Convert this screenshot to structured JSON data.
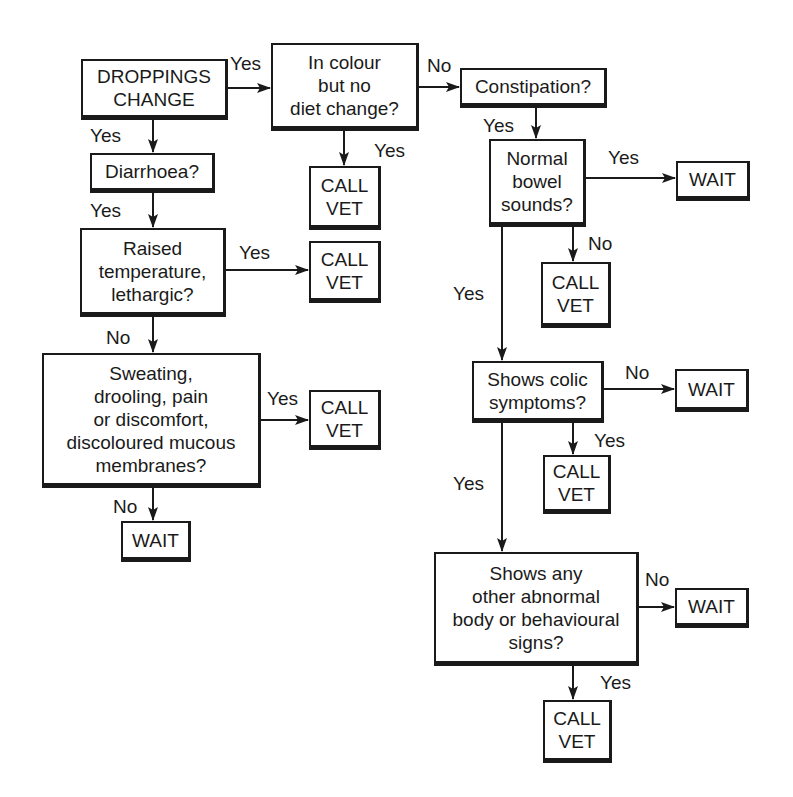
{
  "diagram": {
    "type": "flowchart",
    "nodes": {
      "start": {
        "text": "DROPPINGS\nCHANGE"
      },
      "colour": {
        "text": "In colour\nbut no\ndiet change?"
      },
      "constipation": {
        "text": "Constipation?"
      },
      "colour_vet": {
        "text": "CALL\nVET"
      },
      "diarrhoea": {
        "text": "Diarrhoea?"
      },
      "bowel": {
        "text": "Normal\nbowel\nsounds?"
      },
      "bowel_wait": {
        "text": "WAIT"
      },
      "raised": {
        "text": "Raised\ntemperature,\nlethargic?"
      },
      "raised_vet": {
        "text": "CALL\nVET"
      },
      "bowel_vet": {
        "text": "CALL\nVET"
      },
      "sweating": {
        "text": "Sweating,\ndrooling, pain\nor discomfort,\ndiscoloured mucous\nmembranes?"
      },
      "sweating_vet": {
        "text": "CALL\nVET"
      },
      "sweating_wait": {
        "text": "WAIT"
      },
      "colic": {
        "text": "Shows colic\nsymptoms?"
      },
      "colic_wait": {
        "text": "WAIT"
      },
      "colic_vet": {
        "text": "CALL\nVET"
      },
      "other": {
        "text": "Shows any\nother abnormal\nbody or behavioural\nsigns?"
      },
      "other_wait": {
        "text": "WAIT"
      },
      "other_vet": {
        "text": "CALL\nVET"
      }
    },
    "edge_labels": {
      "start_to_colour": "Yes",
      "colour_to_constipation": "No",
      "start_to_diarrhoea": "Yes",
      "colour_to_vet": "Yes",
      "constipation_to_bowel": "Yes",
      "bowel_to_wait": "Yes",
      "diarrhoea_to_raised": "Yes",
      "raised_to_vet": "Yes",
      "bowel_to_vet": "No",
      "bowel_to_colic": "Yes",
      "raised_to_sweating": "No",
      "sweating_to_vet": "Yes",
      "colic_to_wait": "No",
      "colic_to_vet": "Yes",
      "colic_to_other": "Yes",
      "sweating_to_wait": "No",
      "other_to_wait": "No",
      "other_to_vet": "Yes"
    },
    "colors": {
      "ink": "#1a1a1a",
      "background": "#ffffff"
    }
  }
}
